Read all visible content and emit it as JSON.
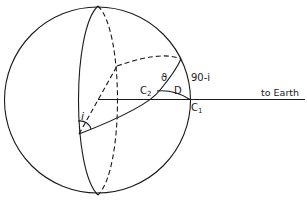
{
  "diagram": {
    "stroke_color": "#1a1a1a",
    "background": "#ffffff",
    "labels": {
      "inclination": "i",
      "theta": "ϑ",
      "complement": "90-i",
      "c2": "C",
      "c2_sub": "2",
      "d": "D",
      "c1": "C",
      "c1_sub": "1",
      "earth": "to Earth"
    }
  }
}
